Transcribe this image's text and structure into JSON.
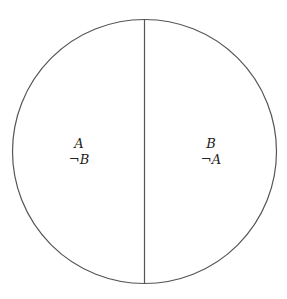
{
  "diagram": {
    "circle": {
      "cx": 144.5,
      "cy": 151.5,
      "r": 132,
      "stroke": "#555555"
    },
    "divider": {
      "x": 144.5,
      "stroke": "#555555"
    },
    "left_region": {
      "line1": "A",
      "line2_symbol": "¬",
      "line2_var": "B"
    },
    "right_region": {
      "line1": "B",
      "line2_symbol": "¬",
      "line2_var": "A"
    }
  }
}
